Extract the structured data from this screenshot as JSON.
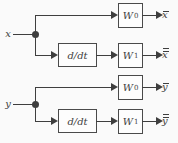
{
  "colors": {
    "ink": "#3e3e3e",
    "background": "#fafafa",
    "block_fill": "#fdfdfd"
  },
  "diagrams": [
    {
      "input": "x",
      "w0": {
        "base": "W",
        "sub": "0"
      },
      "w1": {
        "base": "W",
        "sub": "1"
      },
      "ddt": "d/dt",
      "outputs": {
        "w0": {
          "base": "x",
          "overlines": "1"
        },
        "w1": {
          "base": "x",
          "overlines": "2"
        }
      }
    },
    {
      "input": "y",
      "w0": {
        "base": "W",
        "sub": "0"
      },
      "w1": {
        "base": "W",
        "sub": "1"
      },
      "ddt": "d/dt",
      "outputs": {
        "w0": {
          "base": "y",
          "overlines": "1"
        },
        "w1": {
          "base": "y",
          "overlines": "2"
        }
      }
    }
  ]
}
